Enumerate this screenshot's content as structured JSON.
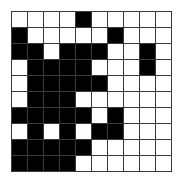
{
  "figure": {
    "name": "binary-grid-pattern",
    "type": "pixel-grid",
    "rows": 10,
    "cols": 10,
    "colors": {
      "filled": "#000000",
      "empty": "#ffffff",
      "gridline": "#3a3a3a",
      "background": "#ffffff"
    },
    "cells": [
      [
        0,
        0,
        0,
        0,
        1,
        0,
        0,
        0,
        0,
        0
      ],
      [
        1,
        0,
        0,
        0,
        0,
        0,
        1,
        0,
        0,
        0
      ],
      [
        1,
        1,
        0,
        1,
        1,
        1,
        0,
        0,
        1,
        0
      ],
      [
        0,
        1,
        1,
        1,
        1,
        0,
        0,
        0,
        1,
        0
      ],
      [
        0,
        1,
        1,
        1,
        1,
        1,
        0,
        0,
        0,
        0
      ],
      [
        0,
        1,
        1,
        1,
        0,
        0,
        0,
        0,
        0,
        0
      ],
      [
        1,
        1,
        1,
        1,
        1,
        0,
        1,
        0,
        0,
        0
      ],
      [
        0,
        1,
        0,
        1,
        0,
        1,
        1,
        0,
        0,
        0
      ],
      [
        1,
        1,
        1,
        1,
        1,
        0,
        0,
        0,
        0,
        0
      ],
      [
        1,
        1,
        1,
        1,
        0,
        0,
        0,
        0,
        0,
        0
      ]
    ]
  }
}
